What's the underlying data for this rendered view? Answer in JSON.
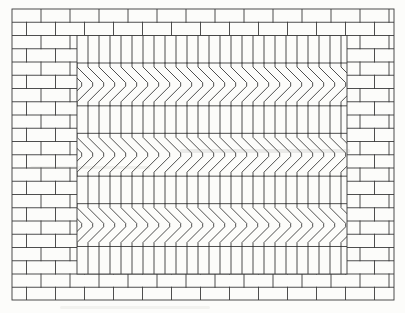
{
  "figure": {
    "name": "brick-paving-pattern-engraving",
    "canvas": {
      "width": 405,
      "height": 313,
      "paper_color": "#fcfcfa",
      "line_color": "#3a3a3a",
      "line_width": 0.9
    },
    "outer_rect": {
      "x": 12,
      "y": 9,
      "width": 382,
      "height": 291
    },
    "border": {
      "pattern": "running-bond",
      "brick_width": 29,
      "row_height": 13.25,
      "alternate_row_offset": 14.5
    },
    "panel": {
      "x": 77,
      "y": 35.5,
      "width": 270,
      "height": 238.5,
      "bands": [
        "soldier",
        "chevron",
        "soldier",
        "chevron",
        "soldier",
        "chevron",
        "soldier"
      ],
      "soldier": {
        "height": 27.5,
        "brick_width": 11
      },
      "chevron": {
        "pattern": "chevron-herringbone",
        "direction": "right",
        "height": 42.8333,
        "unit_width": 11,
        "end_tick": 4,
        "apex_jog": 3.5
      }
    },
    "print_artifacts": [
      {
        "x": 180,
        "y": 149,
        "width": 170,
        "height": 4,
        "color": "#9a9a94",
        "opacity": 0.18
      },
      {
        "x": 30,
        "y": 166,
        "width": 120,
        "height": 3,
        "color": "#9a9a94",
        "opacity": 0.12
      },
      {
        "x": 60,
        "y": 306,
        "width": 150,
        "height": 3,
        "color": "#b5b5ae",
        "opacity": 0.14
      }
    ]
  }
}
